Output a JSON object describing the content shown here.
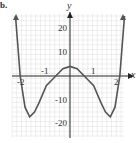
{
  "problem_label": "b.",
  "chart_data": {
    "type": "line",
    "title": "",
    "xlabel": "x",
    "ylabel": "y",
    "xlim": [
      -2.4,
      2.4
    ],
    "ylim": [
      -25,
      25
    ],
    "grid": true,
    "x_ticks": [
      "-2",
      "-1",
      "1",
      "2"
    ],
    "y_ticks": [
      "20",
      "10",
      "-10",
      "-20"
    ],
    "series": [
      {
        "name": "f(x)",
        "x": [
          -2.3,
          -2.1,
          -1.9,
          -1.7,
          -1.5,
          -1.3,
          -1.0,
          -0.6,
          -0.3,
          0,
          0.3,
          0.6,
          1.0,
          1.3,
          1.5,
          1.7,
          1.9,
          2.1,
          2.3
        ],
        "y": [
          25,
          0,
          -13,
          -17,
          -15,
          -11,
          -4,
          0,
          3,
          4,
          3,
          0,
          -4,
          -11,
          -15,
          -17,
          -13,
          0,
          25
        ]
      }
    ]
  }
}
